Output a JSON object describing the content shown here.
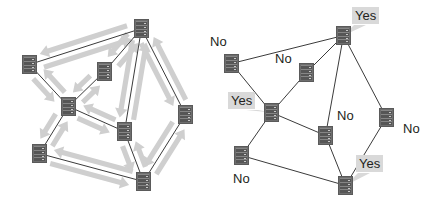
{
  "figure": {
    "background": "#ffffff",
    "edge_color": "#3b3b3b",
    "arrow_color": "#cfcfcf",
    "node_color": "#6e6e6e",
    "label_highlight": "#d9d9d9",
    "label_text_color": "#231f20"
  },
  "panels": [
    {
      "id": "left-panel",
      "name": "flooding-graph",
      "shows_arrows": true,
      "shows_labels": false,
      "nodes": [
        {
          "id": "n1",
          "name": "server-node-top",
          "x": 134,
          "y": 19
        },
        {
          "id": "n2",
          "name": "server-node-upper-left",
          "x": 22,
          "y": 55
        },
        {
          "id": "n3",
          "name": "server-node-upper-mid",
          "x": 97,
          "y": 62
        },
        {
          "id": "n4",
          "name": "server-node-center",
          "x": 61,
          "y": 97
        },
        {
          "id": "n5",
          "name": "server-node-right",
          "x": 178,
          "y": 105
        },
        {
          "id": "n6",
          "name": "server-node-mid-right",
          "x": 117,
          "y": 122
        },
        {
          "id": "n7",
          "name": "server-node-lower-left",
          "x": 32,
          "y": 144
        },
        {
          "id": "n8",
          "name": "server-node-bottom",
          "x": 136,
          "y": 172
        }
      ],
      "edges": [
        {
          "from": "n2",
          "to": "n1"
        },
        {
          "from": "n1",
          "to": "n3"
        },
        {
          "from": "n1",
          "to": "n6"
        },
        {
          "from": "n1",
          "to": "n5"
        },
        {
          "from": "n2",
          "to": "n4"
        },
        {
          "from": "n3",
          "to": "n4"
        },
        {
          "from": "n4",
          "to": "n6"
        },
        {
          "from": "n4",
          "to": "n7"
        },
        {
          "from": "n6",
          "to": "n8"
        },
        {
          "from": "n5",
          "to": "n8"
        },
        {
          "from": "n7",
          "to": "n8"
        }
      ]
    },
    {
      "id": "right-panel",
      "name": "decision-graph",
      "shows_arrows": false,
      "shows_labels": true,
      "nodes": [
        {
          "id": "m1",
          "name": "server-node-top",
          "x": 336,
          "y": 26,
          "label": "Yes",
          "highlight": true,
          "label_x": 352,
          "label_y": 7,
          "tail": "left-down"
        },
        {
          "id": "m2",
          "name": "server-node-upper-left",
          "x": 224,
          "y": 54,
          "label": "No",
          "highlight": false,
          "label_x": 207,
          "label_y": 33,
          "tail": "none"
        },
        {
          "id": "m3",
          "name": "server-node-upper-mid",
          "x": 299,
          "y": 63,
          "label": "No",
          "highlight": false,
          "label_x": 272,
          "label_y": 50,
          "tail": "none"
        },
        {
          "id": "m4",
          "name": "server-node-center",
          "x": 264,
          "y": 103,
          "label": "Yes",
          "highlight": true,
          "label_x": 228,
          "label_y": 92,
          "tail": "right-down"
        },
        {
          "id": "m5",
          "name": "server-node-right",
          "x": 379,
          "y": 108,
          "label": "No",
          "highlight": false,
          "label_x": 400,
          "label_y": 120,
          "tail": "none"
        },
        {
          "id": "m6",
          "name": "server-node-mid-right",
          "x": 318,
          "y": 126,
          "label": "No",
          "highlight": false,
          "label_x": 334,
          "label_y": 107,
          "tail": "none"
        },
        {
          "id": "m7",
          "name": "server-node-lower-left",
          "x": 234,
          "y": 146,
          "label": "No",
          "highlight": false,
          "label_x": 230,
          "label_y": 170,
          "tail": "none"
        },
        {
          "id": "m8",
          "name": "server-node-bottom",
          "x": 338,
          "y": 176,
          "label": "Yes",
          "highlight": true,
          "label_x": 356,
          "label_y": 155,
          "tail": "left-down"
        }
      ],
      "edges": [
        {
          "from": "m2",
          "to": "m1"
        },
        {
          "from": "m1",
          "to": "m3"
        },
        {
          "from": "m1",
          "to": "m6"
        },
        {
          "from": "m1",
          "to": "m5"
        },
        {
          "from": "m2",
          "to": "m4"
        },
        {
          "from": "m3",
          "to": "m4"
        },
        {
          "from": "m4",
          "to": "m6"
        },
        {
          "from": "m4",
          "to": "m7"
        },
        {
          "from": "m6",
          "to": "m8"
        },
        {
          "from": "m5",
          "to": "m8"
        },
        {
          "from": "m7",
          "to": "m8"
        }
      ]
    }
  ]
}
